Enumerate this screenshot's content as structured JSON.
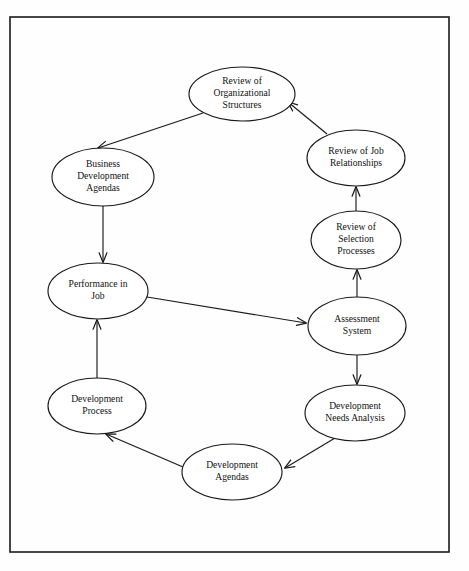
{
  "diagram": {
    "frame": {
      "x": 10,
      "y": 17,
      "width": 439,
      "height": 535,
      "stroke": "#1a1a1a"
    },
    "canvas": {
      "width": 469,
      "height": 571,
      "background": "#fefefe"
    },
    "style": {
      "node_fill": "#ffffff",
      "node_stroke": "#1a1a1a",
      "edge_stroke": "#1a1a1a",
      "text_color": "#111111"
    },
    "nodes": [
      {
        "id": "review-organizational-structures",
        "lines": [
          "Review of",
          "Organizational",
          "Structures"
        ],
        "cx": 242,
        "cy": 94,
        "rx": 53,
        "ry": 27
      },
      {
        "id": "business-development-agendas",
        "lines": [
          "Business",
          "Development",
          "Agendas"
        ],
        "cx": 103,
        "cy": 177,
        "rx": 51,
        "ry": 29
      },
      {
        "id": "review-job-relationships",
        "lines": [
          "Review of Job",
          "Relationships"
        ],
        "cx": 356,
        "cy": 158,
        "rx": 49,
        "ry": 28
      },
      {
        "id": "review-selection-processes",
        "lines": [
          "Review of",
          "Selection",
          "Processes"
        ],
        "cx": 356,
        "cy": 240,
        "rx": 45,
        "ry": 29
      },
      {
        "id": "performance-in-job",
        "lines": [
          "Performance in",
          "Job"
        ],
        "cx": 98,
        "cy": 291,
        "rx": 50,
        "ry": 28
      },
      {
        "id": "assessment-system",
        "lines": [
          "Assessment",
          "System"
        ],
        "cx": 357,
        "cy": 326,
        "rx": 49,
        "ry": 29
      },
      {
        "id": "development-process",
        "lines": [
          "Development",
          "Process"
        ],
        "cx": 97,
        "cy": 406,
        "rx": 49,
        "ry": 28
      },
      {
        "id": "development-needs-analysis",
        "lines": [
          "Development",
          "Needs Analysis"
        ],
        "cx": 355,
        "cy": 413,
        "rx": 50,
        "ry": 28
      },
      {
        "id": "development-agendas",
        "lines": [
          "Development",
          "Agendas"
        ],
        "cx": 232,
        "cy": 472,
        "rx": 50,
        "ry": 28
      }
    ],
    "edges": [
      {
        "id": "edge-org-structures-to-business-agendas",
        "from": "review-organizational-structures",
        "to": "business-development-agendas",
        "path": "M 203 113 L 98 148",
        "arrow": true
      },
      {
        "id": "edge-business-agendas-to-performance",
        "from": "business-development-agendas",
        "to": "performance-in-job",
        "path": "M 103 206 L 103 262",
        "arrow": true
      },
      {
        "id": "edge-performance-to-assessment",
        "from": "performance-in-job",
        "to": "assessment-system",
        "path": "M 147 297 L 306 323",
        "arrow": true
      },
      {
        "id": "edge-assessment-to-needs-analysis",
        "from": "assessment-system",
        "to": "development-needs-analysis",
        "path": "M 357 355 L 357 384",
        "arrow": true
      },
      {
        "id": "edge-needs-analysis-to-dev-agendas",
        "from": "development-needs-analysis",
        "to": "development-agendas",
        "path": "M 335 438 L 285 468",
        "arrow": true
      },
      {
        "id": "edge-dev-agendas-to-dev-process",
        "from": "development-agendas",
        "to": "development-process",
        "path": "M 183 467 L 106 434",
        "arrow": true
      },
      {
        "id": "edge-dev-process-to-performance",
        "from": "development-process",
        "to": "performance-in-job",
        "path": "M 97 378 L 97 320",
        "arrow": true
      },
      {
        "id": "edge-selection-to-job-relationships",
        "from": "review-selection-processes",
        "to": "review-job-relationships",
        "path": "M 356 211 L 356 187",
        "arrow": true
      },
      {
        "id": "edge-assessment-to-selection",
        "from": "assessment-system",
        "to": "review-selection-processes",
        "path": "M 357 297 L 357 270",
        "arrow": true
      },
      {
        "id": "edge-job-relationships-to-org-structures",
        "from": "review-job-relationships",
        "to": "review-organizational-structures",
        "path": "M 327 134 L 288 102",
        "arrow": true
      }
    ]
  }
}
